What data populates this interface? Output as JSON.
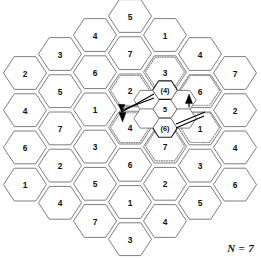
{
  "figure": {
    "caption": "N = 7",
    "cluster_size": 7
  },
  "chart_data": {
    "type": "diagram",
    "annotation": "N = 7",
    "grid_style": "flat-top hexagons, 7 staggered columns",
    "columns": [
      {
        "index": 1,
        "cx": 25,
        "cy_start": 73,
        "labels": [
          "2",
          "4",
          "6",
          "1"
        ]
      },
      {
        "index": 2,
        "cx": 60,
        "cy_start": 54,
        "labels": [
          "3",
          "5",
          "7",
          "2",
          "4"
        ]
      },
      {
        "index": 3,
        "cx": 95,
        "cy_start": 35,
        "labels": [
          "4",
          "6",
          "1",
          "3",
          "5",
          "7"
        ]
      },
      {
        "index": 4,
        "cx": 130,
        "cy_start": 16,
        "labels": [
          "5",
          "7",
          "2",
          "4",
          "6",
          "1",
          "3"
        ]
      },
      {
        "index": 5,
        "cx": 165,
        "cy_start": 35,
        "labels": [
          "1",
          "3",
          "5",
          "7",
          "2",
          "4"
        ]
      },
      {
        "index": 6,
        "cx": 200,
        "cy_start": 54,
        "labels": [
          "4",
          "6",
          "1",
          "3",
          "5"
        ]
      },
      {
        "index": 7,
        "cx": 235,
        "cy_start": 73,
        "labels": [
          "7",
          "2",
          "4",
          "6"
        ]
      }
    ],
    "highlighted_cochannel_cells": {
      "note": "dotted outlines mark the co-channel cell set surrounding the center cluster",
      "labels": [
        "3",
        "2",
        "4",
        "7",
        "6",
        "1"
      ]
    },
    "center_cluster": {
      "note": "small interior hexagons forming the serving cluster",
      "labels": [
        "(4)",
        "5",
        "(6)"
      ]
    },
    "arrows": [
      {
        "from": "center",
        "to": "cell-4-left",
        "direction": "down-left"
      },
      {
        "from": "center",
        "to": "cell-6-right",
        "direction": "up-right"
      }
    ]
  },
  "cells": {
    "c1": [
      "2",
      "4",
      "6",
      "1"
    ],
    "c2": [
      "3",
      "5",
      "7",
      "2",
      "4"
    ],
    "c3": [
      "4",
      "6",
      "1",
      "3",
      "5",
      "7"
    ],
    "c4": [
      "5",
      "7",
      "2",
      "4",
      "6",
      "1",
      "3"
    ],
    "c5": [
      "1",
      "3",
      "5",
      "7",
      "2",
      "4"
    ],
    "c6": [
      "4",
      "6",
      "1",
      "3",
      "5"
    ],
    "c7": [
      "7",
      "2",
      "4",
      "6"
    ],
    "inner": [
      "(4)",
      "5",
      "(6)"
    ]
  }
}
